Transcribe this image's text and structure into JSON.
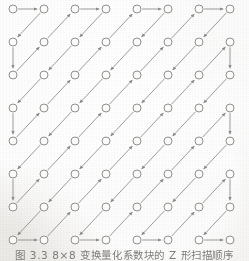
{
  "figure": {
    "caption": "图 3.3   8×8 变换量化系数块的 Z 形扫描顺序",
    "caption_number": "图 3.3",
    "caption_body": "8×8 变换量化系数块的 Z 形扫描顺序",
    "alt_description": "8×8 zigzag scan order of transform-quantized coefficient block",
    "background_color": "#f1f0ee",
    "ink_color": "#8a8a88",
    "node_fill": "#fbfaf9",
    "caption_color": "#6e6c69"
  },
  "grid": {
    "rows": 8,
    "cols": 8,
    "origin_x": 13,
    "origin_y": 9,
    "step_x": 31,
    "step_y": 33,
    "node_radius": 4,
    "node_count": 64,
    "node_name": "coefficient-node"
  },
  "chart_data": {
    "type": "scatter",
    "title": "8×8 变换量化系数块的 Z 形扫描顺序",
    "xlabel": "",
    "ylabel": "",
    "grid": false,
    "legend": "none",
    "xlim": [
      0,
      7
    ],
    "ylim": [
      0,
      7
    ],
    "categories": [
      "col0",
      "col1",
      "col2",
      "col3",
      "col4",
      "col5",
      "col6",
      "col7"
    ],
    "values": [
      0,
      1,
      2,
      3,
      4,
      5,
      6,
      7
    ],
    "zigzag_order": [
      [
        0,
        0
      ],
      [
        0,
        1
      ],
      [
        1,
        0
      ],
      [
        2,
        0
      ],
      [
        1,
        1
      ],
      [
        0,
        2
      ],
      [
        0,
        3
      ],
      [
        1,
        2
      ],
      [
        2,
        1
      ],
      [
        3,
        0
      ],
      [
        4,
        0
      ],
      [
        3,
        1
      ],
      [
        2,
        2
      ],
      [
        1,
        3
      ],
      [
        0,
        4
      ],
      [
        0,
        5
      ],
      [
        1,
        4
      ],
      [
        2,
        3
      ],
      [
        3,
        2
      ],
      [
        4,
        1
      ],
      [
        5,
        0
      ],
      [
        6,
        0
      ],
      [
        5,
        1
      ],
      [
        4,
        2
      ],
      [
        3,
        3
      ],
      [
        2,
        4
      ],
      [
        1,
        5
      ],
      [
        0,
        6
      ],
      [
        0,
        7
      ],
      [
        1,
        6
      ],
      [
        2,
        5
      ],
      [
        3,
        4
      ],
      [
        4,
        3
      ],
      [
        5,
        2
      ],
      [
        6,
        1
      ],
      [
        7,
        0
      ],
      [
        7,
        1
      ],
      [
        6,
        2
      ],
      [
        5,
        3
      ],
      [
        4,
        4
      ],
      [
        3,
        5
      ],
      [
        2,
        6
      ],
      [
        1,
        7
      ],
      [
        2,
        7
      ],
      [
        3,
        6
      ],
      [
        4,
        5
      ],
      [
        5,
        4
      ],
      [
        6,
        3
      ],
      [
        7,
        2
      ],
      [
        7,
        3
      ],
      [
        6,
        4
      ],
      [
        5,
        5
      ],
      [
        4,
        6
      ],
      [
        3,
        7
      ],
      [
        4,
        7
      ],
      [
        5,
        6
      ],
      [
        6,
        5
      ],
      [
        7,
        4
      ],
      [
        7,
        5
      ],
      [
        6,
        6
      ],
      [
        5,
        7
      ],
      [
        6,
        7
      ],
      [
        7,
        6
      ],
      [
        7,
        7
      ]
    ]
  }
}
